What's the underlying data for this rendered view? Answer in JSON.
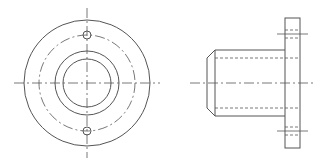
{
  "drawing": {
    "type": "orthographic technical drawing",
    "subject": "flanged bushing",
    "line_color": "#555555",
    "background": "#ffffff",
    "views": [
      {
        "name": "front-view",
        "center": [
          87,
          83
        ],
        "outer_circle_r": 63,
        "bolt_circle_r": 48,
        "boss_circle_r": 32,
        "bore_circle_r": 24,
        "bolt_holes": [
          {
            "cx": 87,
            "cy": 35,
            "r": 4
          },
          {
            "cx": 87,
            "cy": 131,
            "r": 4
          }
        ],
        "centerlines": {
          "horizontal": [
            14,
            160
          ],
          "vertical": [
            8,
            158
          ]
        }
      },
      {
        "name": "side-view",
        "flange": {
          "x": 285,
          "y": 18,
          "w": 15,
          "h": 130
        },
        "body": {
          "x1": 215,
          "x2": 285,
          "y1": 50,
          "y2": 116
        },
        "chamfer": {
          "x": 206,
          "inset": 8
        },
        "bore_hidden_y": [
          58,
          108
        ],
        "axis_y": 83,
        "axis_x": [
          190,
          313
        ],
        "bolt_hole_hidden": [
          {
            "y1": 30,
            "y2": 38,
            "center": 34
          },
          {
            "y1": 127,
            "y2": 135,
            "center": 131
          }
        ]
      }
    ]
  }
}
